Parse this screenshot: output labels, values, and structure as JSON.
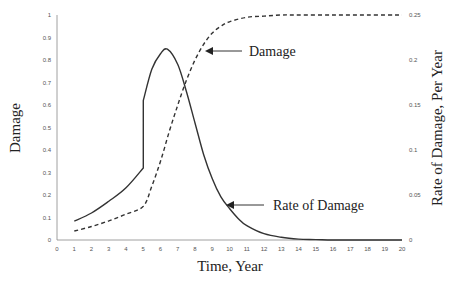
{
  "chart_data": {
    "type": "line",
    "title": "",
    "xlabel": "Time, Year",
    "ylabel": "Damage",
    "ylabel_right": "Rate of Damage, Per Year",
    "xlim": [
      0,
      20
    ],
    "ylim": [
      0,
      1
    ],
    "ylim_right": [
      0,
      0.25
    ],
    "grid": false,
    "legend": "none (inline annotations)",
    "x_ticks": [
      "0",
      "1",
      "2",
      "3",
      "4",
      "5",
      "6",
      "7",
      "8",
      "9",
      "10",
      "11",
      "12",
      "13",
      "14",
      "15",
      "16",
      "17",
      "18",
      "19",
      "20"
    ],
    "y_ticks_left": [
      "0",
      "0.1",
      "0.2",
      "0.3",
      "0.4",
      "0.5",
      "0.6",
      "0.7",
      "0.8",
      "0.9",
      "1"
    ],
    "y_ticks_right": [
      "0",
      "0.05",
      "0.1",
      "0.15",
      "0.2",
      "0.25"
    ],
    "series": [
      {
        "name": "Damage",
        "axis": "left",
        "style": "dashed",
        "x": [
          1,
          2,
          3,
          4,
          5,
          5.5,
          6,
          6.5,
          7,
          7.5,
          8,
          8.5,
          9,
          9.5,
          10,
          11,
          12,
          13,
          14,
          16,
          18,
          20
        ],
        "values": [
          0.04,
          0.06,
          0.085,
          0.115,
          0.15,
          0.24,
          0.35,
          0.48,
          0.6,
          0.71,
          0.8,
          0.87,
          0.92,
          0.95,
          0.97,
          0.99,
          0.995,
          1.0,
          1.0,
          1.0,
          1.0,
          1.0
        ]
      },
      {
        "name": "Rate of Damage",
        "axis": "right",
        "style": "solid",
        "x": [
          1,
          2,
          3,
          4,
          5,
          5,
          5.5,
          6,
          6.4,
          7,
          7.5,
          8,
          8.5,
          9,
          9.5,
          10,
          10.5,
          11,
          12,
          13,
          14,
          15,
          16,
          18,
          20
        ],
        "values": [
          0.021,
          0.03,
          0.043,
          0.058,
          0.08,
          0.155,
          0.19,
          0.207,
          0.212,
          0.195,
          0.165,
          0.13,
          0.095,
          0.068,
          0.048,
          0.035,
          0.024,
          0.016,
          0.007,
          0.003,
          0.001,
          0.0005,
          0.0,
          0.0,
          0.0
        ]
      }
    ],
    "annotations": [
      {
        "text": "Damage",
        "arrow_to": {
          "x": 8.5,
          "y_left": 0.87
        }
      },
      {
        "text": "Rate of Damage",
        "arrow_to": {
          "x": 9.8,
          "y_right": 0.04
        }
      }
    ]
  }
}
